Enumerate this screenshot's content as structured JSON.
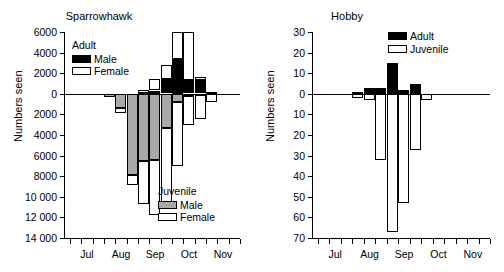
{
  "figure": {
    "shared_ylabel": "Numbers seen",
    "panels": [
      "Sparrowhawk",
      "Hobby"
    ]
  },
  "chart_data": [
    {
      "type": "bar",
      "title": "Sparrowhawk",
      "xlabel": "",
      "ylabel": "Numbers seen",
      "ylim": [
        -14000,
        6000
      ],
      "yticks": [
        6000,
        4000,
        2000,
        0,
        2000,
        4000,
        6000,
        8000,
        10000,
        12000,
        14000
      ],
      "ytick_labels": [
        "6000",
        "4000",
        "2000",
        "0",
        "2000",
        "4000",
        "6000",
        "8000",
        "10 000",
        "12 000",
        "14 000"
      ],
      "ytick_values": [
        6000,
        4000,
        2000,
        0,
        -2000,
        -4000,
        -6000,
        -8000,
        -10000,
        -12000,
        -14000
      ],
      "grid": false,
      "legend_position": "upper-left and lower-right",
      "categories": [
        "Jul-1",
        "Jul-2",
        "Jul-3",
        "Aug-1",
        "Aug-2",
        "Aug-3",
        "Sep-1",
        "Sep-2",
        "Sep-3",
        "Oct-1",
        "Oct-2",
        "Oct-3",
        "Nov-1",
        "Nov-2",
        "Nov-3"
      ],
      "xtick_labels": [
        "Jul",
        "Aug",
        "Sep",
        "Oct",
        "Nov"
      ],
      "series": [
        {
          "name": "Adult Male",
          "direction": "up",
          "color": "#000000",
          "values": [
            0,
            0,
            0,
            0,
            0,
            0,
            100,
            300,
            1400,
            3400,
            1300,
            1300,
            200,
            0,
            0
          ]
        },
        {
          "name": "Adult Female",
          "direction": "up",
          "color": "#ffffff",
          "values": [
            0,
            0,
            0,
            0,
            0,
            0,
            300,
            1100,
            1400,
            2600,
            4700,
            300,
            0,
            0,
            0
          ]
        },
        {
          "name": "Juvenile Male",
          "direction": "down",
          "color": "#a9a9a9",
          "values": [
            0,
            0,
            0,
            300,
            1400,
            7900,
            6500,
            6400,
            3300,
            800,
            200,
            100,
            0,
            0,
            0
          ]
        },
        {
          "name": "Juvenile Female",
          "direction": "down",
          "color": "#ffffff",
          "values": [
            0,
            0,
            0,
            0,
            500,
            1000,
            4200,
            5300,
            7200,
            6200,
            2800,
            2300,
            800,
            0,
            0
          ]
        }
      ],
      "legends": [
        {
          "title": "Adult",
          "entries": [
            {
              "label": "Male",
              "swatch": "black"
            },
            {
              "label": "Female",
              "swatch": "white"
            }
          ]
        },
        {
          "title": "Juvenile",
          "entries": [
            {
              "label": "Male",
              "swatch": "gray"
            },
            {
              "label": "Female",
              "swatch": "white"
            }
          ]
        }
      ]
    },
    {
      "type": "bar",
      "title": "Hobby",
      "xlabel": "",
      "ylabel": "Numbers seen",
      "ylim": [
        -70,
        30
      ],
      "ytick_labels": [
        "30",
        "20",
        "10",
        "0",
        "10",
        "20",
        "30",
        "40",
        "50",
        "60",
        "70"
      ],
      "ytick_values": [
        30,
        20,
        10,
        0,
        -10,
        -20,
        -30,
        -40,
        -50,
        -60,
        -70
      ],
      "grid": false,
      "legend_position": "upper-right",
      "categories": [
        "Jul-1",
        "Jul-2",
        "Jul-3",
        "Aug-1",
        "Aug-2",
        "Aug-3",
        "Sep-1",
        "Sep-2",
        "Sep-3",
        "Oct-1",
        "Oct-2",
        "Oct-3",
        "Nov-1",
        "Nov-2",
        "Nov-3"
      ],
      "xtick_labels": [
        "Jul",
        "Aug",
        "Sep",
        "Oct",
        "Nov"
      ],
      "series": [
        {
          "name": "Adult",
          "direction": "up",
          "color": "#000000",
          "values": [
            0,
            0,
            0,
            1,
            3,
            3,
            15,
            2,
            5,
            0,
            0,
            0,
            0,
            0,
            0
          ]
        },
        {
          "name": "Juvenile",
          "direction": "down",
          "color": "#ffffff",
          "values": [
            0,
            0,
            0,
            2,
            3,
            32,
            67,
            53,
            27,
            3,
            0,
            0,
            0,
            0,
            0
          ]
        }
      ],
      "legends": [
        {
          "title": "",
          "entries": [
            {
              "label": "Adult",
              "swatch": "black"
            },
            {
              "label": "Juvenile",
              "swatch": "white"
            }
          ]
        }
      ]
    }
  ]
}
